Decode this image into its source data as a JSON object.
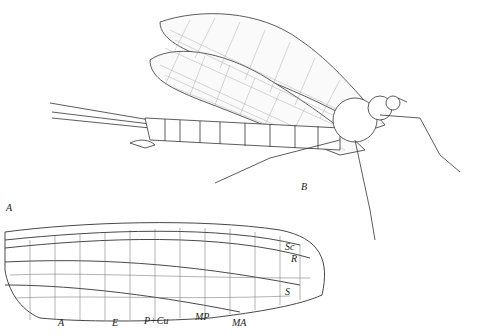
{
  "figure": {
    "panel_a_label": "A",
    "panel_b_label": "B",
    "wing_vein_labels": {
      "Sc": "Sc",
      "R": "R",
      "S": "S",
      "A": "A",
      "E": "E",
      "P_Cu": "P+Cu",
      "MP": "MP",
      "MA": "MA"
    }
  },
  "colors": {
    "ink": "#222222",
    "background": "#ffffff"
  }
}
